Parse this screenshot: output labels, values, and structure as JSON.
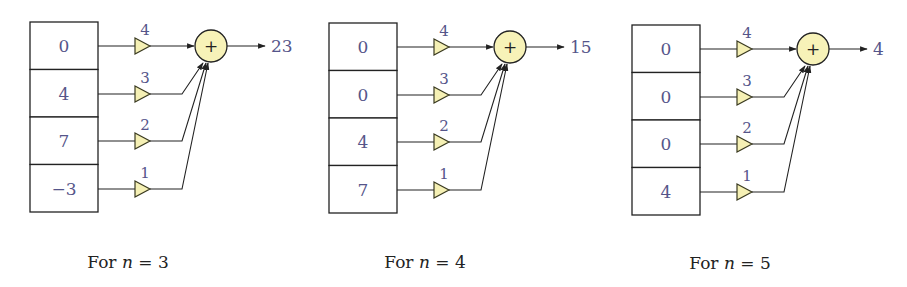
{
  "diagram": {
    "type": "weighted-sum filter diagrams",
    "colors": {
      "value_text": "#55558a",
      "triangle_fill": "#f5f0b4",
      "adder_fill": "#f7f2b8",
      "stroke": "#222222"
    },
    "panels": [
      {
        "caption_prefix": "For ",
        "caption_var": "n",
        "caption_suffix": " = 3",
        "cells": [
          "0",
          "4",
          "7",
          "−3"
        ],
        "weights": [
          "4",
          "3",
          "2",
          "1"
        ],
        "adder_symbol": "+",
        "output": "23"
      },
      {
        "caption_prefix": "For ",
        "caption_var": "n",
        "caption_suffix": " = 4",
        "cells": [
          "0",
          "0",
          "4",
          "7"
        ],
        "weights": [
          "4",
          "3",
          "2",
          "1"
        ],
        "adder_symbol": "+",
        "output": "15"
      },
      {
        "caption_prefix": "For ",
        "caption_var": "n",
        "caption_suffix": " = 5",
        "cells": [
          "0",
          "0",
          "0",
          "4"
        ],
        "weights": [
          "4",
          "3",
          "2",
          "1"
        ],
        "adder_symbol": "+",
        "output": "4"
      }
    ]
  }
}
